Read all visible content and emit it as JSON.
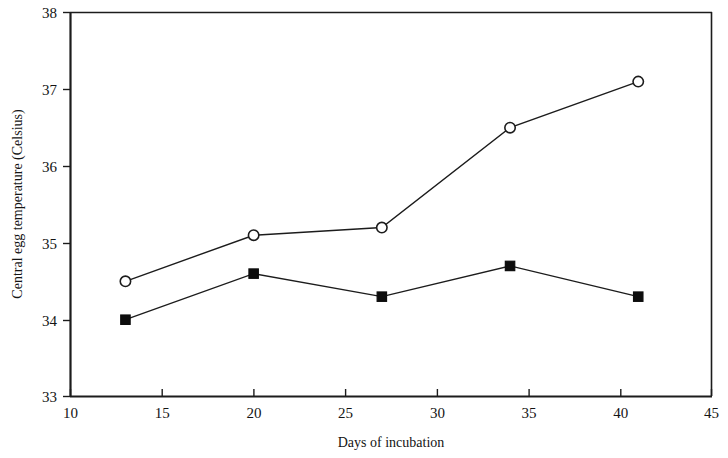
{
  "chart_data": {
    "type": "line",
    "title": "",
    "subtitle": "",
    "xlabel": "Days of incubation",
    "ylabel": "Central egg temperature (Celsius)",
    "xlim": [
      10,
      45
    ],
    "ylim": [
      33,
      38
    ],
    "xticks": [
      10,
      15,
      20,
      25,
      30,
      35,
      40,
      45
    ],
    "yticks": [
      33,
      34,
      35,
      36,
      37,
      38
    ],
    "xtick_labels": [
      "10",
      "15",
      "20",
      "25",
      "30",
      "35",
      "40",
      "45"
    ],
    "ytick_labels": [
      "33",
      "34",
      "35",
      "36",
      "37",
      "38"
    ],
    "grid": false,
    "legend": null,
    "legend_position": "none",
    "x": [
      13,
      20,
      27,
      34,
      41
    ],
    "series": [
      {
        "name": "open-circle-series",
        "marker": "open-circle",
        "color": "#1c1c1c",
        "values": [
          34.5,
          35.1,
          35.2,
          36.5,
          37.1
        ]
      },
      {
        "name": "filled-square-series",
        "marker": "filled-square",
        "color": "#0d0d0d",
        "values": [
          34.0,
          34.6,
          34.3,
          34.7,
          34.3
        ]
      }
    ],
    "annotations": []
  }
}
